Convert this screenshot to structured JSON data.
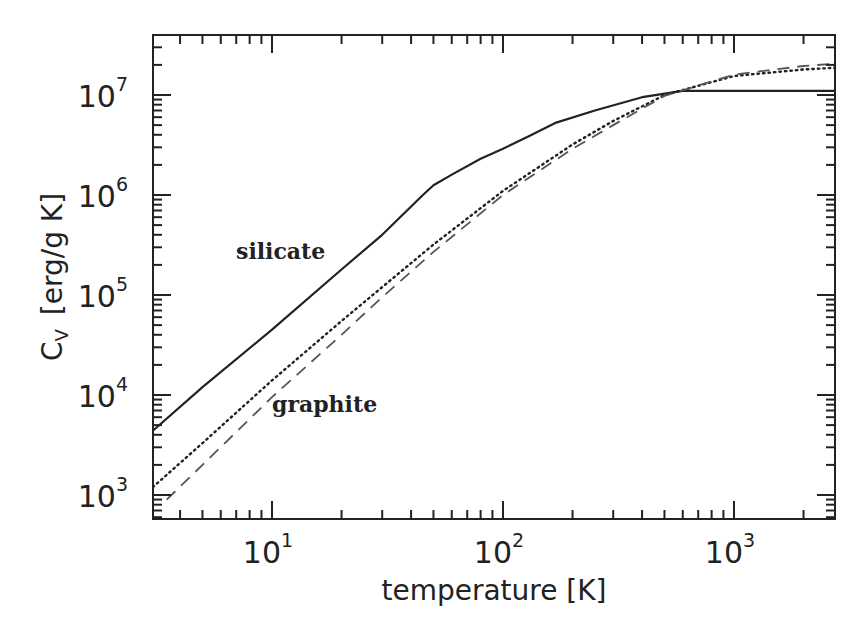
{
  "chart_data": {
    "type": "line",
    "title": "",
    "xlabel": "temperature [K]",
    "ylabel": "C_V [erg/g K]",
    "ylabel_main": "C",
    "ylabel_sub": "V",
    "ylabel_units": "[erg/g K]",
    "xscale": "log",
    "yscale": "log",
    "xlim": [
      3.05,
      3100
    ],
    "ylim": [
      600,
      35000000
    ],
    "grid": false,
    "x_ticks": [
      {
        "base": "10",
        "exp": "1",
        "value": 10
      },
      {
        "base": "10",
        "exp": "2",
        "value": 100
      },
      {
        "base": "10",
        "exp": "3",
        "value": 1000
      }
    ],
    "y_ticks": [
      {
        "base": "10",
        "exp": "3",
        "value": 1000
      },
      {
        "base": "10",
        "exp": "4",
        "value": 10000
      },
      {
        "base": "10",
        "exp": "5",
        "value": 100000
      },
      {
        "base": "10",
        "exp": "6",
        "value": 1000000
      },
      {
        "base": "10",
        "exp": "7",
        "value": 10000000
      }
    ],
    "annotations": [
      {
        "text": "silicate",
        "x": 18,
        "y": 250000
      },
      {
        "text": "graphite",
        "x": 18,
        "y": 9000
      }
    ],
    "series": [
      {
        "name": "silicate",
        "style": "solid",
        "x": [
          3.05,
          5,
          10,
          20,
          30,
          45,
          50,
          60,
          80,
          100,
          130,
          170,
          250,
          400,
          600,
          3100
        ],
        "values": [
          4400,
          12000,
          45000,
          180000,
          400000,
          1000000,
          1250000,
          1600000,
          2300000,
          2900000,
          3900000,
          5300000,
          7000000,
          9500000,
          11000000,
          11000000
        ]
      },
      {
        "name": "graphite (dotted)",
        "style": "dotted",
        "x": [
          3.05,
          5,
          10,
          20,
          30,
          50,
          100,
          200,
          300,
          500,
          1000,
          2000,
          3100
        ],
        "values": [
          1200,
          3300,
          14000,
          55000,
          120000,
          320000,
          1100000,
          3200000,
          5500000,
          10000000,
          15500000,
          18000000,
          19000000
        ]
      },
      {
        "name": "graphite (dashed)",
        "style": "dashed",
        "x": [
          3.5,
          5,
          10,
          20,
          30,
          50,
          100,
          200,
          300,
          500,
          1000,
          2000,
          3100
        ],
        "values": [
          900,
          2000,
          9500,
          40000,
          95000,
          270000,
          1000000,
          2900000,
          5000000,
          9800000,
          16000000,
          19500000,
          21000000
        ]
      }
    ]
  }
}
